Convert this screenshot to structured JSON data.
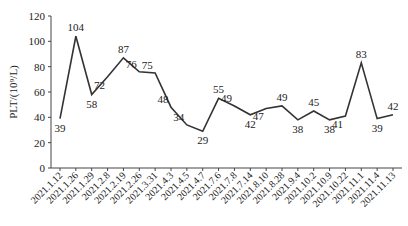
{
  "chart_data": {
    "type": "line",
    "title": "",
    "xlabel": "",
    "ylabel": "PLT/(10⁹/L)",
    "ylim": [
      0,
      120
    ],
    "yticks": [
      0,
      20,
      40,
      60,
      80,
      100,
      120
    ],
    "grid": false,
    "legend": null,
    "categories": [
      "2021.1.12",
      "2021.1.26",
      "2021.1.29",
      "2021.2.8",
      "2021.2.19",
      "2021.2.26",
      "2021.3.31",
      "2021.4.3",
      "2021.4.5",
      "2021.4.7",
      "2021.7.6",
      "2021.7.8",
      "2021.7.14",
      "2021.8.10",
      "2021.8.28",
      "2021.9.4",
      "2021.10.2",
      "2021.10.9",
      "2021.10.22",
      "2021.11.1",
      "2021.11.4",
      "2021.11.13"
    ],
    "values": [
      39,
      104,
      58,
      72,
      87,
      76,
      75,
      48,
      34,
      29,
      55,
      49,
      42,
      47,
      49,
      38,
      45,
      38,
      41,
      83,
      39,
      42
    ],
    "line_color": "#333333"
  }
}
